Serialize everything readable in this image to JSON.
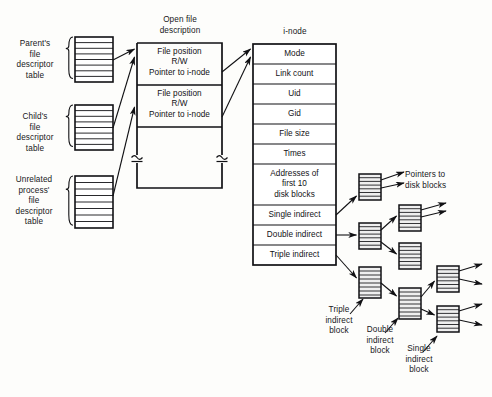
{
  "left_tables": [
    {
      "label": "Parent's\nfile\ndescriptor\ntable",
      "rows": 8
    },
    {
      "label": "Child's\nfile\ndescriptor\ntable",
      "rows": 8
    },
    {
      "label": "Unrelated\nprocess'\nfile\ndescriptor\ntable",
      "rows": 8
    }
  ],
  "open_file_description": {
    "title": "Open file\ndescription",
    "entries": [
      "File position\nR/W\nPointer to i-node",
      "File position\nR/W\nPointer to i-node"
    ],
    "has_break_marks": true
  },
  "inode": {
    "title": "i-node",
    "fields": [
      "Mode",
      "Link count",
      "Uid",
      "Gid",
      "File size",
      "Times",
      "Addresses of\nfirst 10\ndisk blocks",
      "Single indirect",
      "Double indirect",
      "Triple indirect"
    ]
  },
  "annotations": [
    {
      "id": "pointers-to-disk-blocks",
      "text": "Pointers to\ndisk blocks"
    },
    {
      "id": "triple-indirect-block",
      "text": "Triple\nindirect\nblock"
    },
    {
      "id": "double-indirect-block",
      "text": "Double\nindirect\nblock"
    },
    {
      "id": "single-indirect-block",
      "text": "Single\nindirect\nblock"
    }
  ],
  "disk_blocks": [
    {
      "id": "block-single-indirect-top",
      "rows": 7
    },
    {
      "id": "block-double-indirect-mid",
      "rows": 7
    },
    {
      "id": "block-double-child-upper",
      "rows": 7
    },
    {
      "id": "block-double-child-lower",
      "rows": 7
    },
    {
      "id": "block-triple-indirect",
      "rows": 8
    },
    {
      "id": "block-triple-child-double",
      "rows": 8
    },
    {
      "id": "block-triple-grandchild-upper",
      "rows": 7
    },
    {
      "id": "block-triple-grandchild-lower",
      "rows": 7
    }
  ],
  "colors": {
    "stroke": "#111114",
    "text": "#17171a",
    "background": "#fdfdfb",
    "block_fill": "#efefef"
  }
}
